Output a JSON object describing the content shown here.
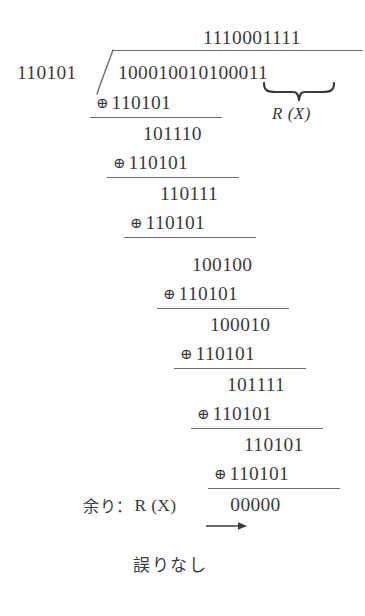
{
  "figure": {
    "type": "binary-long-division",
    "title_text": "",
    "colors": {
      "ink": "#3b3b3f",
      "rule": "#6d6d72",
      "background": "#ffffff"
    },
    "quotient": "1110001111",
    "divisor": "110101",
    "dividend": "100010010100011",
    "brace_label": "R (X)",
    "brace_covers_digits": "00011",
    "steps": [
      {
        "xor_symbol": "⊕",
        "xor_operand": "110101",
        "result": "101110"
      },
      {
        "xor_symbol": "⊕",
        "xor_operand": "110101",
        "result": "110111"
      },
      {
        "xor_symbol": "⊕",
        "xor_operand": "110101",
        "result": "100100"
      },
      {
        "xor_symbol": "⊕",
        "xor_operand": "110101",
        "result": "100010"
      },
      {
        "xor_symbol": "⊕",
        "xor_operand": "110101",
        "result": "101111"
      },
      {
        "xor_symbol": "⊕",
        "xor_operand": "110101",
        "result": "110101"
      },
      {
        "xor_symbol": "⊕",
        "xor_operand": "110101",
        "result": "00000"
      }
    ],
    "remainder": {
      "label": "余り：",
      "symbol": "R (X)",
      "arrow": "⟶",
      "value": "00000"
    },
    "conclusion": "誤りなし"
  }
}
